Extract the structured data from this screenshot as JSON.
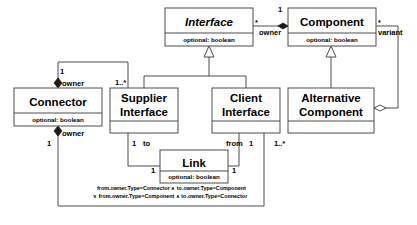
{
  "diagram": {
    "type": "uml-class-diagram",
    "title": "",
    "attribute_compartment_text": "optional: boolean",
    "classes": [
      {
        "id": "interface",
        "name": "Interface",
        "abstract": true,
        "attributes": "optional: boolean",
        "x": 165,
        "y": 8,
        "w": 88,
        "h": 38
      },
      {
        "id": "component",
        "name": "Component",
        "abstract": false,
        "attributes": "optional: boolean",
        "x": 288,
        "y": 8,
        "w": 88,
        "h": 38
      },
      {
        "id": "connector",
        "name": "Connector",
        "abstract": false,
        "attributes": "optional: boolean",
        "x": 14,
        "y": 88,
        "w": 88,
        "h": 38
      },
      {
        "id": "supplier-interface",
        "name": "Supplier Interface",
        "name_line_1": "Supplier",
        "name_line_2": "Interface",
        "abstract": false,
        "attributes": "",
        "x": 110,
        "y": 88,
        "w": 68,
        "h": 45
      },
      {
        "id": "client-interface",
        "name": "Client Interface",
        "name_line_1": "Client",
        "name_line_2": "Interface",
        "abstract": false,
        "attributes": "",
        "x": 212,
        "y": 88,
        "w": 68,
        "h": 45
      },
      {
        "id": "alternative-component",
        "name": "Alternative Component",
        "name_line_1": "Alternative",
        "name_line_2": "Component",
        "abstract": false,
        "attributes": "",
        "x": 288,
        "y": 88,
        "w": 86,
        "h": 45
      },
      {
        "id": "link",
        "name": "Link",
        "abstract": false,
        "attributes": "optional: boolean",
        "x": 160,
        "y": 150,
        "w": 68,
        "h": 33
      }
    ],
    "associations": [
      {
        "id": "interface-owner-component",
        "from": "interface",
        "to": "component",
        "role_label": "owner",
        "source_multiplicity": "*",
        "target_multiplicity": "1",
        "kind": "composition"
      },
      {
        "id": "component-variant-alternative",
        "from": "component",
        "to": "alternative-component",
        "role_label": "variant",
        "source_multiplicity": "*",
        "target_multiplicity": "",
        "kind": "aggregation"
      },
      {
        "id": "connector-owner-supplier",
        "from": "connector",
        "to": "supplier-interface",
        "role_label": "owner",
        "source_multiplicity": "1",
        "target_multiplicity": "1..*",
        "kind": "composition"
      },
      {
        "id": "connector-owner-client",
        "from": "connector",
        "to": "client-interface",
        "role_label": "owner",
        "source_multiplicity": "1",
        "target_multiplicity": "1..*",
        "kind": "composition"
      },
      {
        "id": "supplier-to-link",
        "from": "supplier-interface",
        "to": "link",
        "role_label": "to",
        "source_multiplicity": "1",
        "target_multiplicity": "1",
        "kind": "association"
      },
      {
        "id": "client-from-link",
        "from": "client-interface",
        "to": "link",
        "role_label": "from",
        "source_multiplicity": "1",
        "target_multiplicity": "1",
        "kind": "association"
      }
    ],
    "generalizations": [
      {
        "id": "supplier-isa-interface",
        "child": "supplier-interface",
        "parent": "interface"
      },
      {
        "id": "client-isa-interface",
        "child": "client-interface",
        "parent": "interface"
      },
      {
        "id": "alternative-isa-component",
        "child": "alternative-component",
        "parent": "component"
      }
    ],
    "labels": {
      "owner_top_left": "owner",
      "owner_bottom_left": "owner",
      "owner_interface_component": "owner",
      "variant": "variant",
      "to": "to",
      "from": "from",
      "mult_star_interface": "*",
      "mult_one_component": "1",
      "mult_star_component": "*",
      "mult_one_connector_top": "1",
      "mult_one_connector_bottom": "1",
      "mult_one_many_supplier": "1..*",
      "mult_one_many_client": "1..*",
      "mult_one_supplier_bottom": "1",
      "mult_one_client_bottom": "1",
      "mult_one_link_left": "1",
      "mult_one_link_right": "1"
    },
    "constraint": {
      "line_1": "from.owner.Type=Connector ∧ to.owner.Type=Component",
      "line_2": "∨ from.owner.Type=Component ∧ to.owner.Type=Connector"
    },
    "colors": {
      "background": "#ffffff",
      "box_stroke": "#4d4d4d",
      "text": "#000000",
      "diamond_filled": "#1a1a1a"
    }
  }
}
